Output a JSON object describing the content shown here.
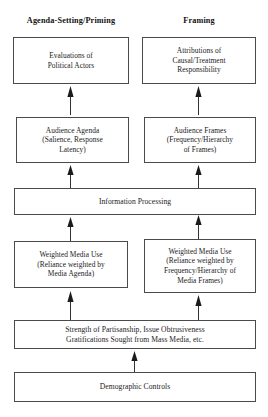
{
  "diagram": {
    "type": "flowchart",
    "title": "",
    "orientation": "bottom-to-top",
    "columns": [
      {
        "id": "left",
        "label": "Agenda-Setting/Priming"
      },
      {
        "id": "right",
        "label": "Framing"
      }
    ],
    "nodes": [
      {
        "id": "evaluations",
        "label": "Evaluations of\nPolitical Actors",
        "column": "left",
        "level": 1
      },
      {
        "id": "attributions",
        "label": "Attributions of\nCausal/Treatment\nResponsibility",
        "column": "right",
        "level": 1
      },
      {
        "id": "audience-agenda",
        "label": "Audience Agenda\n(Salience, Response\nLatency)",
        "column": "left",
        "level": 2
      },
      {
        "id": "audience-frames",
        "label": "Audience Frames\n(Frequency/Hierarchy\nof Frames)",
        "column": "right",
        "level": 2
      },
      {
        "id": "information-processing",
        "label": "Information Processing",
        "column": "full",
        "level": 3
      },
      {
        "id": "weighted-media-use-agenda",
        "label": "Weighted Media Use\n(Reliance weighted by\nMedia Agenda)",
        "column": "left",
        "level": 4
      },
      {
        "id": "weighted-media-use-frames",
        "label": "Weighted Media Use\n(Reliance weighted by\nFrequency/Hierarchy  of\nMedia Frames)",
        "column": "right",
        "level": 4
      },
      {
        "id": "partisanship",
        "label": "Strength of Partisanship,  Issue Obtrusiveness\nGratifications Sought from Mass Media, etc.",
        "column": "full",
        "level": 5
      },
      {
        "id": "demographic-controls",
        "label": "Demographic Controls",
        "column": "full",
        "level": 6
      }
    ],
    "edges": [
      {
        "from": "audience-agenda",
        "to": "evaluations",
        "style": "solid",
        "arrowhead": "up"
      },
      {
        "from": "audience-frames",
        "to": "attributions",
        "style": "solid",
        "arrowhead": "up"
      },
      {
        "from": "information-processing",
        "to": "audience-agenda",
        "style": "solid",
        "arrowhead": "up"
      },
      {
        "from": "information-processing",
        "to": "audience-frames",
        "style": "solid",
        "arrowhead": "up"
      },
      {
        "from": "weighted-media-use-agenda",
        "to": "information-processing",
        "style": "solid",
        "arrowhead": "up"
      },
      {
        "from": "weighted-media-use-frames",
        "to": "information-processing",
        "style": "solid",
        "arrowhead": "up"
      },
      {
        "from": "partisanship",
        "to": "weighted-media-use-agenda",
        "style": "solid",
        "arrowhead": "up"
      },
      {
        "from": "partisanship",
        "to": "weighted-media-use-frames",
        "style": "solid",
        "arrowhead": "up"
      },
      {
        "from": "demographic-controls",
        "to": "partisanship",
        "style": "solid",
        "arrowhead": "up"
      }
    ],
    "colors": {
      "background": "#ffffff",
      "box_border": "#4a4a4a",
      "text": "#1b1b1b",
      "header_text": "#111111",
      "arrow": "#1b1b1b"
    }
  }
}
